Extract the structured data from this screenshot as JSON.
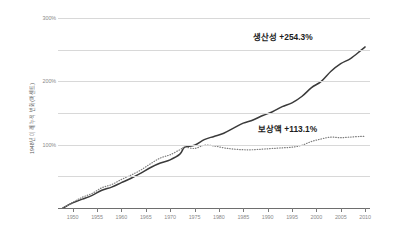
{
  "chart_data": {
    "type": "line",
    "title": "",
    "xlabel": "",
    "ylabel": "1948년 이래 누적 변화(퍼센트)",
    "xlim": [
      1947,
      2011
    ],
    "ylim": [
      0,
      300
    ],
    "grid": true,
    "legend_position": "inline-annotation",
    "xticks": [
      "1950",
      "1955",
      "1960",
      "1965",
      "1970",
      "1975",
      "1980",
      "1985",
      "1990",
      "1995",
      "2000",
      "2005",
      "2010"
    ],
    "xtick_values": [
      1950,
      1955,
      1960,
      1965,
      1970,
      1975,
      1980,
      1985,
      1990,
      1995,
      2000,
      2005,
      2010
    ],
    "yticks": [
      "100%",
      "200%",
      "300%"
    ],
    "ytick_values": [
      100,
      200,
      300
    ],
    "gridline_values": [
      0,
      50,
      100,
      150,
      200,
      250,
      300
    ],
    "annotations": [
      {
        "text": "생산성 +254.3%",
        "series": "생산성",
        "value": 254.3
      },
      {
        "text": "보상액 +113.1%",
        "series": "보상액",
        "value": 113.1
      }
    ],
    "series": [
      {
        "name": "생산성",
        "style": "solid",
        "color": "#3a3a3a",
        "final_value": 254.3,
        "x": [
          1948,
          1950,
          1952,
          1954,
          1956,
          1958,
          1960,
          1962,
          1964,
          1966,
          1968,
          1970,
          1972,
          1973,
          1975,
          1977,
          1979,
          1981,
          1983,
          1985,
          1987,
          1989,
          1991,
          1993,
          1995,
          1997,
          1999,
          2001,
          2003,
          2005,
          2007,
          2009,
          2010
        ],
        "values": [
          0,
          8,
          14,
          20,
          28,
          33,
          40,
          47,
          55,
          64,
          71,
          76,
          85,
          96,
          99,
          108,
          113,
          118,
          126,
          134,
          139,
          146,
          152,
          160,
          166,
          176,
          190,
          200,
          216,
          228,
          236,
          248,
          254.3
        ]
      },
      {
        "name": "보상액",
        "style": "dotted",
        "color": "#7d7d7d",
        "final_value": 113.1,
        "x": [
          1948,
          1950,
          1952,
          1954,
          1956,
          1958,
          1960,
          1962,
          1964,
          1966,
          1968,
          1970,
          1972,
          1973,
          1975,
          1977,
          1979,
          1981,
          1983,
          1985,
          1987,
          1989,
          1991,
          1993,
          1995,
          1997,
          1999,
          2001,
          2003,
          2005,
          2007,
          2009,
          2010
        ],
        "values": [
          0,
          9,
          17,
          23,
          32,
          37,
          45,
          52,
          60,
          70,
          79,
          84,
          92,
          96,
          94,
          99,
          98,
          95,
          93,
          92,
          92,
          93,
          94,
          95,
          96,
          99,
          105,
          109,
          112,
          111,
          112,
          113,
          113.1
        ]
      }
    ]
  }
}
